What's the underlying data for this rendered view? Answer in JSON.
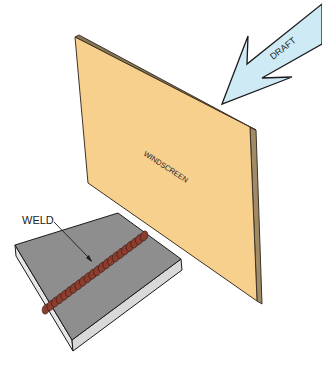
{
  "diagram": {
    "labels": {
      "windscreen": "WINDSCREEN",
      "draft": "DRAFT",
      "weld": "WELD"
    },
    "colors": {
      "board_face": "#F7D08E",
      "board_edge": "#A08B66",
      "board_outline": "#3d3326",
      "arrow_fill": "#CDEAF5",
      "plate_top": "#8E8E8E",
      "plate_side": "#E6E6E6",
      "weld_bead": "#8B3E2F",
      "outline": "#1a1a1a"
    },
    "weld_bead_count": 22
  }
}
